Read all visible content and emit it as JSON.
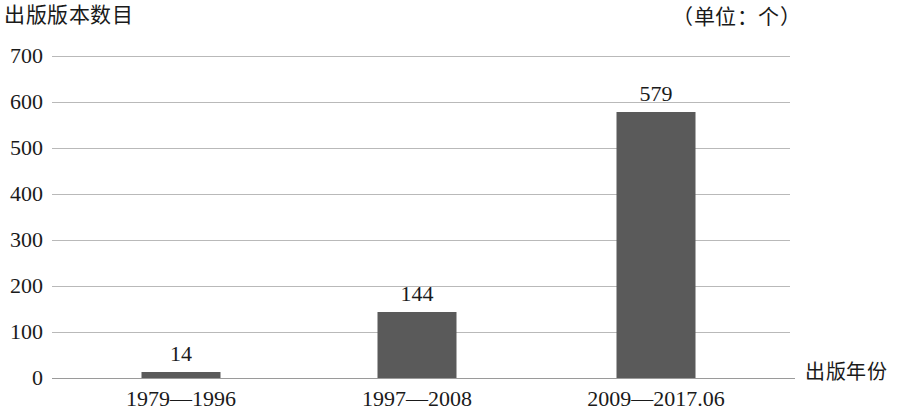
{
  "chart_data": {
    "type": "bar",
    "title": "",
    "ylabel": "出版版本数目",
    "xlabel": "出版年份",
    "unit_note": "（单位：个）",
    "categories": [
      "1979—1996",
      "1997—2008",
      "2009—2017.06"
    ],
    "values": [
      14,
      144,
      579
    ],
    "value_labels": [
      "14",
      "144",
      "579"
    ],
    "ylim": [
      0,
      700
    ],
    "ytick_labels": [
      "700",
      "600",
      "500",
      "400",
      "300",
      "200",
      "100",
      "0"
    ],
    "ytick_values": [
      700,
      600,
      500,
      400,
      300,
      200,
      100,
      0
    ],
    "grid": true,
    "legend": "none",
    "series": [
      {
        "name": "出版版本数目",
        "values": [
          14,
          144,
          579
        ]
      }
    ],
    "colors": {
      "bar": "#5a5a5a",
      "gridline": "#b9b9b9",
      "axis": "#9a9a9a",
      "text": "#1a1a1a",
      "background": "#ffffff"
    }
  }
}
